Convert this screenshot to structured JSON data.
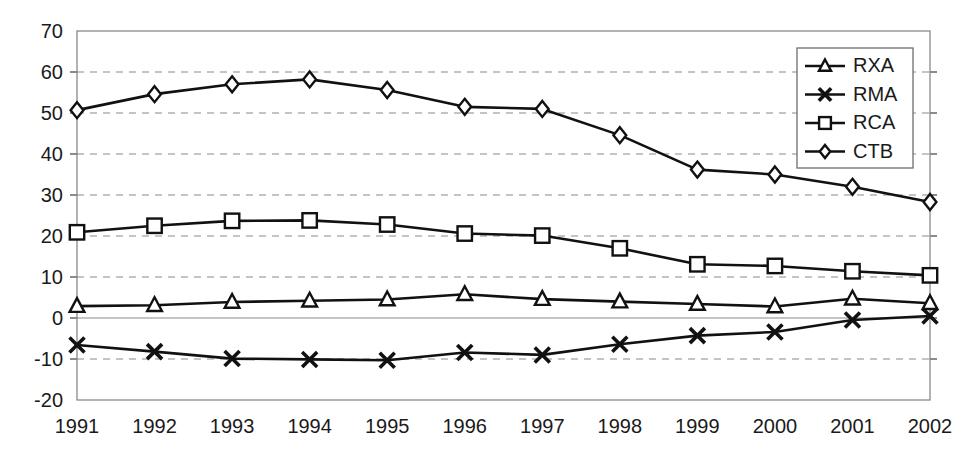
{
  "chart_data": {
    "type": "line",
    "title": "",
    "xlabel": "",
    "ylabel": "",
    "categories": [
      "1991",
      "1992",
      "1993",
      "1994",
      "1995",
      "1996",
      "1997",
      "1998",
      "1999",
      "2000",
      "2001",
      "2002"
    ],
    "ylim": [
      -20,
      70
    ],
    "ytick_labels": [
      "70",
      "60",
      "50",
      "40",
      "30",
      "20",
      "10",
      "0",
      "-10",
      "-20"
    ],
    "ytick_values": [
      70,
      60,
      50,
      40,
      30,
      20,
      10,
      0,
      -10,
      -20
    ],
    "grid": true,
    "grid_axis": "y",
    "legend_position": "top-right",
    "series": [
      {
        "name": "RXA",
        "marker": "triangle",
        "values": [
          2.9,
          3.1,
          3.9,
          4.2,
          4.5,
          5.8,
          4.6,
          4.0,
          3.4,
          2.8,
          4.7,
          3.6
        ]
      },
      {
        "name": "RMA",
        "marker": "x",
        "values": [
          -6.6,
          -8.2,
          -9.9,
          -10.1,
          -10.3,
          -8.4,
          -9.0,
          -6.4,
          -4.3,
          -3.4,
          -0.5,
          0.5
        ]
      },
      {
        "name": "RCA",
        "marker": "square",
        "values": [
          20.9,
          22.5,
          23.7,
          23.8,
          22.8,
          20.6,
          20.1,
          17.0,
          13.1,
          12.7,
          11.4,
          10.4
        ]
      },
      {
        "name": "CTB",
        "marker": "diamond",
        "values": [
          50.7,
          54.6,
          57.0,
          58.2,
          55.6,
          51.5,
          51.0,
          44.6,
          36.2,
          35.0,
          32.0,
          28.3
        ]
      }
    ]
  },
  "legend": {
    "items": [
      {
        "label": "RXA",
        "marker": "triangle"
      },
      {
        "label": "RMA",
        "marker": "x"
      },
      {
        "label": "RCA",
        "marker": "square"
      },
      {
        "label": "CTB",
        "marker": "diamond"
      }
    ]
  }
}
